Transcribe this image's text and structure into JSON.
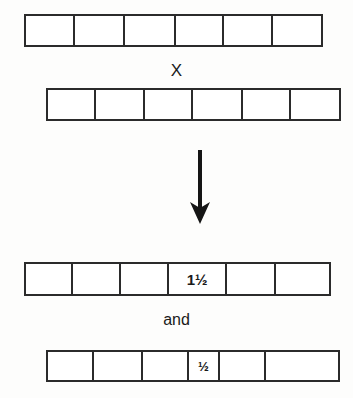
{
  "diagram": {
    "background_color": "#fdfdfc",
    "line_color": "#2b2b2b",
    "operators": {
      "multiply": "X",
      "conjunction": "and"
    },
    "arrow": {
      "name": "down-arrow",
      "direction": "down"
    },
    "strips": [
      {
        "id": "strip-1",
        "name": "top-factor-strip",
        "cell_count": 6,
        "cells": [
          {
            "label": "",
            "width_pct": 16.7
          },
          {
            "label": "",
            "width_pct": 16.7
          },
          {
            "label": "",
            "width_pct": 17.4
          },
          {
            "label": "",
            "width_pct": 16.4
          },
          {
            "label": "",
            "width_pct": 16.4
          },
          {
            "label": "",
            "width_pct": 16.4
          }
        ]
      },
      {
        "id": "strip-2",
        "name": "bottom-factor-strip",
        "cell_count": 6,
        "cells": [
          {
            "label": "",
            "width_pct": 16.6
          },
          {
            "label": "",
            "width_pct": 16.6
          },
          {
            "label": "",
            "width_pct": 16.6
          },
          {
            "label": "",
            "width_pct": 17.2
          },
          {
            "label": "",
            "width_pct": 16.5
          },
          {
            "label": "",
            "width_pct": 16.5
          }
        ]
      },
      {
        "id": "strip-3",
        "name": "result-strip-one-and-half",
        "cell_count": 6,
        "cells": [
          {
            "label": "",
            "width_pct": 15.6
          },
          {
            "label": "",
            "width_pct": 15.6
          },
          {
            "label": "",
            "width_pct": 16.0
          },
          {
            "label": "1½",
            "width_pct": 19.2
          },
          {
            "label": "",
            "width_pct": 16.0
          },
          {
            "label": "",
            "width_pct": 17.6
          }
        ]
      },
      {
        "id": "strip-4",
        "name": "result-strip-half",
        "cell_count": 6,
        "cells": [
          {
            "label": "",
            "width_pct": 16.0
          },
          {
            "label": "",
            "width_pct": 16.7
          },
          {
            "label": "",
            "width_pct": 16.0
          },
          {
            "label": "½",
            "width_pct": 10.5
          },
          {
            "label": "",
            "width_pct": 16.0
          },
          {
            "label": "",
            "width_pct": 24.8
          }
        ]
      }
    ]
  }
}
